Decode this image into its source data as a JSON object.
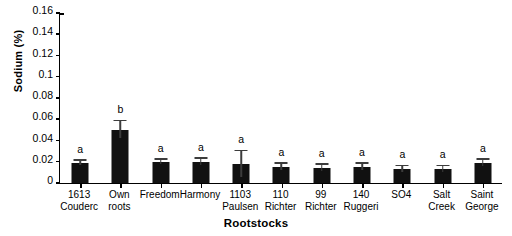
{
  "chart_data": {
    "type": "bar",
    "title": "",
    "xlabel": "Rootstocks",
    "ylabel": "Sodium (%)",
    "ylim": [
      0,
      0.16
    ],
    "ytick_labels": [
      "0",
      "0.02",
      "0.04",
      "0.06",
      "0.08",
      "0.1",
      "0.12",
      "0.14",
      "0.16"
    ],
    "ytick_values": [
      0,
      0.02,
      0.04,
      0.06,
      0.08,
      0.1,
      0.12,
      0.14,
      0.16
    ],
    "grid": false,
    "legend": "none",
    "bar_color": "#111111",
    "categories": [
      "1613 Couderc",
      "Own roots",
      "Freedom",
      "Harmony",
      "1103 Paulsen",
      "110 Richter",
      "99 Richter",
      "140 Ruggeri",
      "SO4",
      "Salt Creek",
      "Saint George"
    ],
    "category_lines": [
      [
        "1613",
        "Couderc"
      ],
      [
        "Own",
        "roots"
      ],
      [
        "Freedom",
        ""
      ],
      [
        "Harmony",
        ""
      ],
      [
        "1103",
        "Paulsen"
      ],
      [
        "110",
        "Richter"
      ],
      [
        "99",
        "Richter"
      ],
      [
        "140",
        "Ruggeri"
      ],
      [
        "SO4",
        ""
      ],
      [
        "Salt",
        "Creek"
      ],
      [
        "Saint",
        "George"
      ]
    ],
    "values": [
      0.019,
      0.05,
      0.02,
      0.02,
      0.018,
      0.015,
      0.014,
      0.015,
      0.013,
      0.013,
      0.019
    ],
    "errors": [
      0.002,
      0.008,
      0.002,
      0.003,
      0.012,
      0.003,
      0.003,
      0.003,
      0.003,
      0.003,
      0.003
    ],
    "significance_letters": [
      "a",
      "b",
      "a",
      "a",
      "a",
      "a",
      "a",
      "a",
      "a",
      "a",
      "a"
    ]
  }
}
